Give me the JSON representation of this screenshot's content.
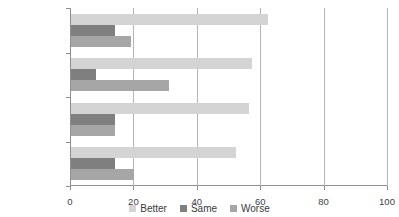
{
  "chart_data": {
    "type": "bar",
    "orientation": "horizontal",
    "title": "",
    "xlabel": "",
    "ylabel": "",
    "xlim": [
      0,
      100
    ],
    "xticks": [
      0,
      20,
      40,
      60,
      80,
      100
    ],
    "grid": "vertical",
    "legend_position": "bottom",
    "categories": [
      "West City",
      "East Docks",
      "Kirkside East",
      "The Valley"
    ],
    "series": [
      {
        "name": "Better",
        "color": "#d4d4d4",
        "values": [
          62,
          57,
          56,
          52
        ]
      },
      {
        "name": "Same",
        "color": "#7f7f7f",
        "values": [
          14,
          8,
          14,
          14
        ]
      },
      {
        "name": "Worse",
        "color": "#a6a6a6",
        "values": [
          19,
          31,
          14,
          20
        ]
      }
    ]
  },
  "clipped_title": "",
  "axis": {
    "tick_labels": [
      "0",
      "20",
      "40",
      "60",
      "80",
      "100"
    ]
  },
  "legend": {
    "items": [
      {
        "label": "Better",
        "color": "#d4d4d4"
      },
      {
        "label": "Same",
        "color": "#7f7f7f"
      },
      {
        "label": "Worse",
        "color": "#a6a6a6"
      }
    ]
  }
}
